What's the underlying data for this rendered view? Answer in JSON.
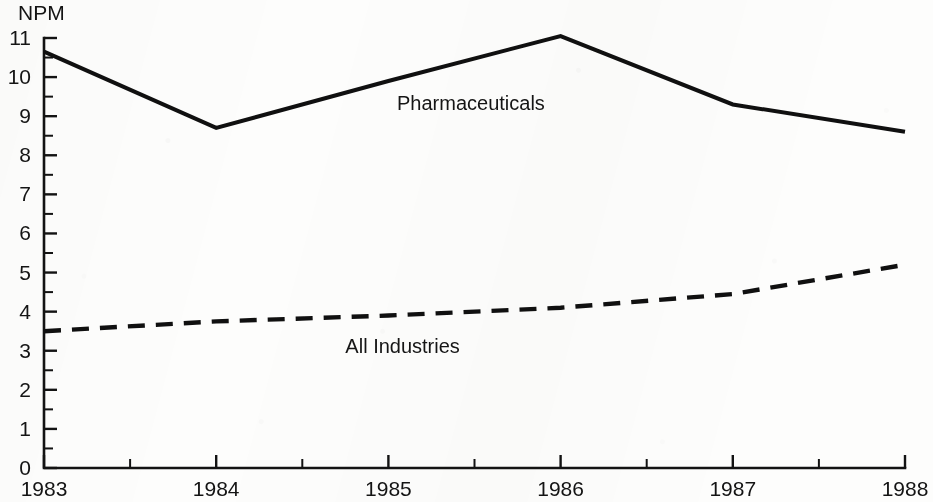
{
  "chart_data": {
    "type": "line",
    "title": "",
    "subtitle": "",
    "ylabel": "NPM",
    "xlabel": "",
    "ylim": [
      0,
      11
    ],
    "xlim": [
      1983,
      1988
    ],
    "grid": false,
    "legend_position": "inline-annotation",
    "y_ticks": [
      "0",
      "1",
      "2",
      "3",
      "4",
      "5",
      "6",
      "7",
      "8",
      "9",
      "10",
      "11"
    ],
    "y_minor_tick_step": 0.5,
    "x_ticks": [
      "1983",
      "1984",
      "1985",
      "1986",
      "1987",
      "1988"
    ],
    "x_minor_tick_step": 0.5,
    "x": [
      1983,
      1984,
      1985,
      1986,
      1987,
      1988
    ],
    "series": [
      {
        "name": "Pharmaceuticals",
        "style": "solid",
        "values": [
          10.65,
          8.7,
          9.9,
          11.05,
          9.3,
          8.6
        ],
        "label_x": 1985.05,
        "label_y": 9.15
      },
      {
        "name": "All Industries",
        "style": "dashed",
        "values": [
          3.5,
          3.75,
          3.9,
          4.1,
          4.45,
          5.2
        ],
        "label_x": 1984.75,
        "label_y": 2.95
      }
    ],
    "colors": {
      "ink": "#101010",
      "axis": "#131313",
      "background": "#fdfdfc"
    }
  }
}
